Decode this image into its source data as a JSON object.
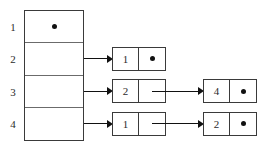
{
  "diagram": {
    "type": "adjacency-list",
    "null_marker": "dot",
    "array": {
      "name": "index-array",
      "rows": [
        {
          "label": "1",
          "content": "dot",
          "has_list": false
        },
        {
          "label": "2",
          "content": "",
          "has_list": true
        },
        {
          "label": "3",
          "content": "",
          "has_list": true
        },
        {
          "label": "4",
          "content": "",
          "has_list": true
        }
      ]
    },
    "lists": [
      {
        "row": "1",
        "nodes": []
      },
      {
        "row": "2",
        "nodes": [
          {
            "value": "1",
            "next": "dot"
          }
        ]
      },
      {
        "row": "3",
        "nodes": [
          {
            "value": "2",
            "next": "arrow"
          },
          {
            "value": "4",
            "next": "dot"
          }
        ]
      },
      {
        "row": "4",
        "nodes": [
          {
            "value": "1",
            "next": "arrow"
          },
          {
            "value": "2",
            "next": "dot"
          }
        ]
      }
    ]
  },
  "colors": {
    "outer_border": "#3a3a3a",
    "inner_divider": "#6b6b6b",
    "ink": "#111111",
    "text": "#2b2b2b",
    "background": "#ffffff"
  }
}
